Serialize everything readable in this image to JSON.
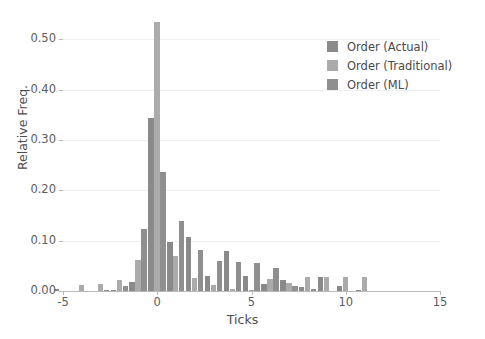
{
  "chart_data": {
    "type": "bar",
    "title": "",
    "subtitle": "",
    "xlabel": "Ticks",
    "ylabel": "Relative Freq.",
    "xlim": [
      -5,
      15
    ],
    "ylim": [
      0.0,
      0.55
    ],
    "xticks": [
      -5,
      0,
      5,
      10,
      15
    ],
    "xtick_labels": [
      "-5",
      "0",
      "5",
      "10",
      "15"
    ],
    "yticks": [
      0.0,
      0.1,
      0.2,
      0.3,
      0.4,
      0.5
    ],
    "ytick_labels": [
      "0.00",
      "0.10",
      "0.20",
      "0.30",
      "0.40",
      "0.50"
    ],
    "grid": true,
    "grid_axis": "y",
    "legend_position": "upper right",
    "bar_mode": "grouped",
    "x": [
      -5,
      -4,
      -3,
      -2,
      -1,
      0,
      1,
      2,
      3,
      4,
      5,
      6,
      7,
      8,
      9,
      10,
      11,
      12,
      13,
      14
    ],
    "series": [
      {
        "name": "Order (Actual)",
        "color": "#8a8a8a",
        "values": [
          0.004,
          0.0,
          0.0,
          0.003,
          0.018,
          0.343,
          0.098,
          0.107,
          0.03,
          0.079,
          0.029,
          0.013,
          0.021,
          0.008,
          0.027,
          0.01,
          0.002,
          0.0,
          0.0,
          0.0
        ]
      },
      {
        "name": "Order (Traditional)",
        "color": "#ababab",
        "values": [
          0.0,
          0.011,
          0.014,
          0.021,
          0.062,
          0.535,
          0.07,
          0.026,
          0.011,
          0.004,
          0.003,
          0.024,
          0.016,
          0.027,
          0.028,
          0.027,
          0.028,
          0.0,
          0.0,
          0.0
        ]
      },
      {
        "name": "Order (ML)",
        "color": "#8f8f8f",
        "values": [
          0.0,
          0.0,
          0.003,
          0.01,
          0.123,
          0.236,
          0.139,
          0.082,
          0.059,
          0.057,
          0.056,
          0.046,
          0.009,
          0.004,
          0.0,
          0.0,
          0.0,
          0.0,
          0.0,
          0.0
        ]
      }
    ],
    "legend_entries": [
      "Order (Actual)",
      "Order (Traditional)",
      "Order (ML)"
    ],
    "annotations": []
  },
  "axes": {
    "axis_color": "#b9b9b9",
    "tick_label_color": "#5d5d5d",
    "axis_label_color": "#4c4c4c",
    "grid_color": "#f0efef"
  }
}
